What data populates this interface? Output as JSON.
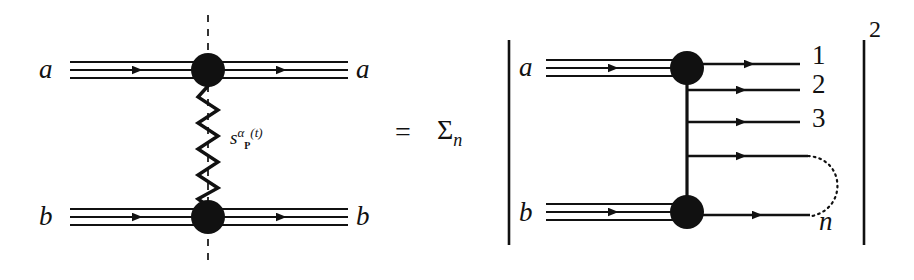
{
  "figure": {
    "type": "feynman-regge-diagram",
    "ink_color": "#111111",
    "background_color": "#ffffff"
  },
  "left_diagram": {
    "name": "pomeron-exchange-elastic-scattering",
    "incoming_top_label": "a",
    "outgoing_top_label": "a",
    "incoming_bottom_label": "b",
    "outgoing_bottom_label": "b",
    "exchange_label_base": "s",
    "exchange_label_exponent_alpha": "α",
    "exchange_label_exponent_subscript": "P",
    "exchange_label_exponent_arg": "(t)",
    "exchange_label_plain": "s^{α_P(t)}",
    "cut_line_style": "dashed-vertical",
    "exchange_line_style": "zigzag",
    "blob_count": 2
  },
  "operators": {
    "equals": "=",
    "sum_symbol": "Σ",
    "sum_subscript": "n",
    "sum_plain": "Σ_n"
  },
  "right_diagram": {
    "name": "multiparticle-production-amplitude-squared",
    "modulus_bar_left": "|",
    "modulus_bar_right": "|",
    "exponent": "2",
    "incoming_top_label": "a",
    "incoming_bottom_label": "b",
    "output_labels": [
      "1",
      "2",
      "3",
      "n"
    ],
    "ellipsis_style": "dotted-arc",
    "blob_count": 2
  }
}
